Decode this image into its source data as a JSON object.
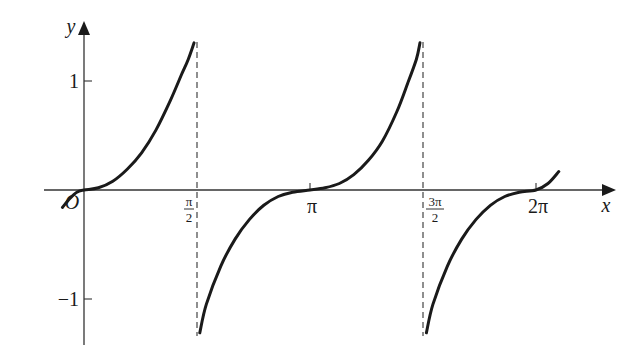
{
  "chart_data": {
    "type": "line",
    "title": "",
    "xlabel": "x",
    "ylabel": "y",
    "origin_label": "O",
    "x_ticks": [
      {
        "value": 1.5708,
        "label_num": "π",
        "label_den": "2"
      },
      {
        "value": 3.1416,
        "label": "π"
      },
      {
        "value": 4.7124,
        "label_num": "3π",
        "label_den": "2"
      },
      {
        "value": 6.2832,
        "label": "2π"
      }
    ],
    "y_ticks": [
      {
        "value": 1,
        "label": "1"
      },
      {
        "value": -1,
        "label": "−1"
      }
    ],
    "xlim": [
      -0.35,
      6.8
    ],
    "ylim": [
      -1.35,
      1.45
    ],
    "asymptotes": [
      1.5708,
      4.7124
    ],
    "asymptote_style": "dashed",
    "grid": false,
    "legend": null,
    "series": [
      {
        "name": "branch-1",
        "x": [
          -0.3,
          -0.2,
          -0.1,
          0,
          0.2,
          0.4,
          0.6,
          0.8,
          1.0,
          1.2,
          1.35,
          1.45,
          1.53
        ],
        "y": [
          -0.16,
          -0.08,
          -0.02,
          0,
          0.02,
          0.08,
          0.19,
          0.34,
          0.55,
          0.82,
          1.05,
          1.2,
          1.35
        ]
      },
      {
        "name": "branch-2",
        "x": [
          1.61,
          1.7,
          1.9,
          2.1,
          2.3,
          2.5,
          2.7,
          2.9,
          3.1416,
          3.35,
          3.55,
          3.75,
          3.95,
          4.15,
          4.35,
          4.5,
          4.62,
          4.67
        ],
        "y": [
          -1.31,
          -1.05,
          -0.7,
          -0.45,
          -0.27,
          -0.14,
          -0.06,
          -0.02,
          0,
          0.02,
          0.06,
          0.14,
          0.27,
          0.45,
          0.72,
          0.98,
          1.2,
          1.35
        ]
      },
      {
        "name": "branch-3",
        "x": [
          4.76,
          4.85,
          5.05,
          5.25,
          5.45,
          5.65,
          5.85,
          6.05,
          6.2832,
          6.45,
          6.6
        ],
        "y": [
          -1.31,
          -1.05,
          -0.7,
          -0.45,
          -0.27,
          -0.14,
          -0.06,
          -0.02,
          0,
          0.06,
          0.17
        ]
      }
    ]
  }
}
